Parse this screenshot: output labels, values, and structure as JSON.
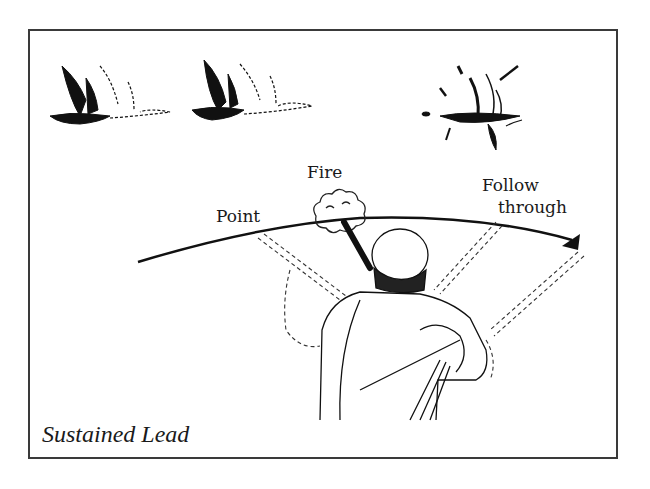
{
  "figure": {
    "caption": "Sustained Lead",
    "labels": {
      "point": "Point",
      "fire": "Fire",
      "follow_line1": "Follow",
      "follow_line2": "through"
    },
    "elements": [
      "bird-in-flight-1",
      "bird-in-flight-2",
      "bird-hit-burst",
      "swing-arc-arrow",
      "hunter-with-shotgun",
      "muzzle-smoke"
    ],
    "colors": {
      "ink": "#1a1a1a",
      "frame": "#3a3a3a",
      "background": "#ffffff"
    }
  }
}
